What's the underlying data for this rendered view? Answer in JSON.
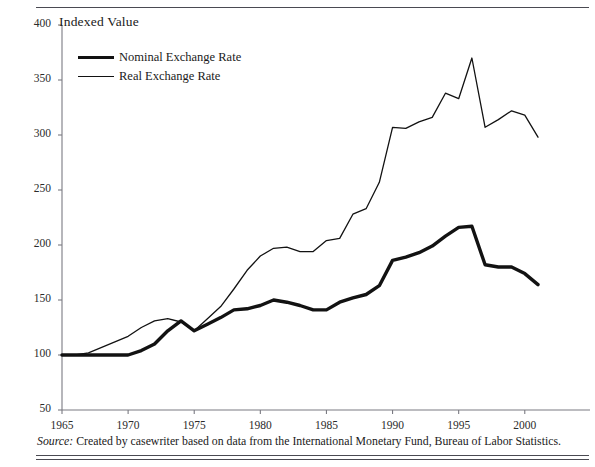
{
  "exhibit": {
    "axis_title": "Indexed Value",
    "source_prefix": "Source:",
    "source_text": " Created by casewriter based on data from the International Monetary Fund, Bureau of Labor Statistics."
  },
  "legend": {
    "position": "inside-top-left",
    "entries": [
      {
        "label": "Nominal Exchange Rate",
        "style": "thick",
        "color": "#121212"
      },
      {
        "label": "Real Exchange Rate",
        "style": "thin",
        "color": "#121212"
      }
    ]
  },
  "axes": {
    "y_ticks": [
      "400",
      "350",
      "300",
      "250",
      "200",
      "150",
      "100",
      "50"
    ],
    "x_ticks": [
      "1965",
      "1970",
      "1975",
      "1980",
      "1985",
      "1990",
      "1995",
      "2000"
    ]
  },
  "chart_data": {
    "type": "line",
    "title": "",
    "subtitle": "",
    "xlabel": "",
    "ylabel": "Indexed Value",
    "xlim": [
      1965,
      2001
    ],
    "ylim": [
      50,
      400
    ],
    "grid": false,
    "legend_position": "inside-top-left",
    "x": [
      1965,
      1966,
      1967,
      1968,
      1969,
      1970,
      1971,
      1972,
      1973,
      1974,
      1975,
      1976,
      1977,
      1978,
      1979,
      1980,
      1981,
      1982,
      1983,
      1984,
      1985,
      1986,
      1987,
      1988,
      1989,
      1990,
      1991,
      1992,
      1993,
      1994,
      1995,
      1996,
      1997,
      1998,
      1999,
      2000,
      2001
    ],
    "series": [
      {
        "name": "Nominal Exchange Rate",
        "color": "#121212",
        "linewidth": 3.4,
        "values": [
          100,
          100,
          100,
          100,
          100,
          100,
          104,
          110,
          122,
          131,
          122,
          128,
          134,
          141,
          142,
          145,
          150,
          148,
          145,
          141,
          141,
          148,
          152,
          155,
          163,
          186,
          189,
          193,
          199,
          208,
          216,
          217,
          182,
          180,
          180,
          174,
          164
        ]
      },
      {
        "name": "Real Exchange Rate",
        "color": "#121212",
        "linewidth": 1.3,
        "values": [
          100,
          100,
          102,
          107,
          112,
          117,
          125,
          131,
          133,
          130,
          122,
          133,
          144,
          160,
          177,
          190,
          197,
          198,
          194,
          194,
          204,
          206,
          228,
          233,
          257,
          307,
          306,
          312,
          316,
          338,
          333,
          370,
          307,
          314,
          322,
          318,
          298
        ]
      }
    ]
  },
  "geometry": {
    "plot_left": 62,
    "plot_right": 538,
    "plot_top": 25,
    "plot_bottom": 410
  }
}
